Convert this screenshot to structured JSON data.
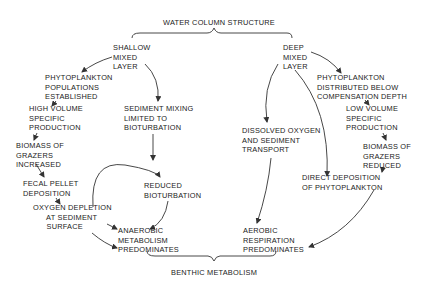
{
  "diagram": {
    "title_top": "WATER COLUMN STRUCTURE",
    "title_bottom": "BENTHIC METABOLISM",
    "left_branch": {
      "root": "SHALLOW\nMIXED\nLAYER",
      "phytoplankton": "PHYTOPLANKTON\nPOPULATIONS\nESTABLISHED",
      "production": "HIGH VOLUME\nSPECIFIC\nPRODUCTION",
      "grazers": "BIOMASS OF\nGRAZERS\nINCREASED",
      "fecal": "FECAL PELLET\nDEPOSITION",
      "oxygen": "OXYGEN DEPLETION\n      AT SEDIMENT\n      SURFACE",
      "sediment_mixing": "SEDIMENT MIXING\nLIMITED TO\nBIOTURBATION",
      "reduced_bioturbation": "REDUCED\nBIOTURBATION",
      "outcome": "ANAEROBIC\nMETABOLISM\nPREDOMINATES"
    },
    "right_branch": {
      "root": "DEEP\nMIXED\nLAYER",
      "phytoplankton": "PHYTOPLANKTON\nDISTRIBUTED BELOW\nCOMPENSATION DEPTH",
      "production": "LOW VOLUME\nSPECIFIC\nPRODUCTION",
      "grazers": "BIOMASS OF\nGRAZERS\nREDUCED",
      "direct_deposition": "DIRECT DEPOSITION\nOF PHYTOPLANKTON",
      "dissolved_oxygen": "DISSOLVED OXYGEN\nAND SEDIMENT\nTRANSPORT",
      "outcome": "AEROBIC\nRESPIRATION\nPREDOMINATES"
    }
  }
}
